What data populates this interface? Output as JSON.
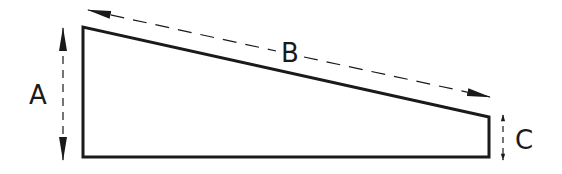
{
  "diagram": {
    "type": "dimensioned-trapezoid",
    "shape": {
      "name": "wedge",
      "points": [
        [
          83,
          27
        ],
        [
          83,
          157
        ],
        [
          489,
          157
        ],
        [
          489,
          117
        ]
      ],
      "stroke": "#1a1a1a"
    },
    "dimensions": [
      {
        "id": "A",
        "label": "A",
        "meaning": "tall left edge height",
        "label_pos": [
          38,
          104
        ]
      },
      {
        "id": "B",
        "label": "B",
        "meaning": "sloped top edge length",
        "label_pos": [
          289,
          61
        ]
      },
      {
        "id": "C",
        "label": "C",
        "meaning": "short right edge height",
        "label_pos": [
          523,
          149
        ]
      }
    ]
  }
}
